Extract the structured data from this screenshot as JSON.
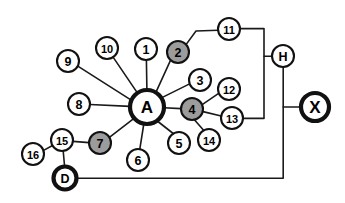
{
  "diagram": {
    "type": "node-link-network",
    "canvas": {
      "width": 345,
      "height": 203
    },
    "background_color": "#ffffff",
    "colors": {
      "node_fill_default": "#ffffff",
      "node_fill_highlight": "#9c9c9c",
      "stroke": "#111111",
      "edge": "#1a1a1a"
    },
    "nodes": [
      {
        "id": "A",
        "label": "A",
        "x": 147,
        "y": 107,
        "r": 17,
        "fill": "white",
        "emphasis": true,
        "size": "lg"
      },
      {
        "id": "X",
        "label": "X",
        "x": 315,
        "y": 107,
        "r": 14,
        "fill": "white",
        "emphasis": true,
        "size": "lg"
      },
      {
        "id": "D",
        "label": "D",
        "x": 65,
        "y": 178,
        "r": 11.5,
        "fill": "white",
        "emphasis": true,
        "size": "md"
      },
      {
        "id": "H",
        "label": "H",
        "x": 283,
        "y": 56,
        "r": 11,
        "fill": "white",
        "emphasis": false,
        "size": "md"
      },
      {
        "id": "1",
        "label": "1",
        "x": 146,
        "y": 49,
        "r": 11,
        "fill": "white",
        "emphasis": false,
        "size": "md"
      },
      {
        "id": "2",
        "label": "2",
        "x": 178,
        "y": 52,
        "r": 11,
        "fill": "gray",
        "emphasis": false,
        "size": "md"
      },
      {
        "id": "3",
        "label": "3",
        "x": 200,
        "y": 80,
        "r": 11,
        "fill": "white",
        "emphasis": false,
        "size": "md"
      },
      {
        "id": "4",
        "label": "4",
        "x": 192,
        "y": 109,
        "r": 11,
        "fill": "gray",
        "emphasis": false,
        "size": "md"
      },
      {
        "id": "5",
        "label": "5",
        "x": 179,
        "y": 143,
        "r": 11,
        "fill": "white",
        "emphasis": false,
        "size": "md"
      },
      {
        "id": "6",
        "label": "6",
        "x": 138,
        "y": 160,
        "r": 11,
        "fill": "white",
        "emphasis": false,
        "size": "md"
      },
      {
        "id": "7",
        "label": "7",
        "x": 100,
        "y": 143,
        "r": 11,
        "fill": "gray",
        "emphasis": false,
        "size": "md"
      },
      {
        "id": "8",
        "label": "8",
        "x": 79,
        "y": 104,
        "r": 11,
        "fill": "white",
        "emphasis": false,
        "size": "md"
      },
      {
        "id": "9",
        "label": "9",
        "x": 68,
        "y": 61,
        "r": 11,
        "fill": "white",
        "emphasis": false,
        "size": "md"
      },
      {
        "id": "10",
        "label": "10",
        "x": 107,
        "y": 48,
        "r": 11,
        "fill": "white",
        "emphasis": false,
        "size": "sm"
      },
      {
        "id": "11",
        "label": "11",
        "x": 229,
        "y": 29,
        "r": 11,
        "fill": "white",
        "emphasis": false,
        "size": "sm"
      },
      {
        "id": "12",
        "label": "12",
        "x": 229,
        "y": 89,
        "r": 11,
        "fill": "white",
        "emphasis": false,
        "size": "sm"
      },
      {
        "id": "13",
        "label": "13",
        "x": 232,
        "y": 118,
        "r": 11,
        "fill": "white",
        "emphasis": false,
        "size": "sm"
      },
      {
        "id": "14",
        "label": "14",
        "x": 209,
        "y": 140,
        "r": 11,
        "fill": "white",
        "emphasis": false,
        "size": "sm"
      },
      {
        "id": "15",
        "label": "15",
        "x": 62,
        "y": 140,
        "r": 11,
        "fill": "white",
        "emphasis": false,
        "size": "sm"
      },
      {
        "id": "16",
        "label": "16",
        "x": 33,
        "y": 154,
        "r": 11,
        "fill": "white",
        "emphasis": false,
        "size": "sm"
      }
    ],
    "edges": [
      {
        "from": "9",
        "to": "A",
        "kind": "straight"
      },
      {
        "from": "10",
        "to": "A",
        "kind": "straight"
      },
      {
        "from": "1",
        "to": "A",
        "kind": "straight"
      },
      {
        "from": "8",
        "to": "A",
        "kind": "straight"
      },
      {
        "from": "2",
        "to": "A",
        "kind": "straight"
      },
      {
        "from": "3",
        "to": "A",
        "kind": "straight"
      },
      {
        "from": "4",
        "to": "A",
        "kind": "straight"
      },
      {
        "from": "5",
        "to": "A",
        "kind": "straight"
      },
      {
        "from": "6",
        "to": "A",
        "kind": "straight"
      },
      {
        "from": "7",
        "to": "A",
        "kind": "straight"
      },
      {
        "from": "12",
        "to": "4",
        "kind": "straight"
      },
      {
        "from": "13",
        "to": "4",
        "kind": "straight"
      },
      {
        "from": "14",
        "to": "4",
        "kind": "straight"
      },
      {
        "from": "15",
        "to": "7",
        "kind": "straight"
      },
      {
        "from": "16",
        "to": "15",
        "kind": "straight"
      },
      {
        "from": "15",
        "to": "D",
        "kind": "straight"
      },
      {
        "from": "2",
        "to": "11",
        "kind": "orthogonal"
      },
      {
        "from": "11",
        "to": "H",
        "kind": "orthogonal"
      },
      {
        "from": "13",
        "to": "H",
        "kind": "orthogonal"
      },
      {
        "from": "H",
        "to": "X",
        "kind": "orthogonal"
      },
      {
        "from": "H",
        "to": "D",
        "kind": "orthogonal"
      }
    ],
    "edge_paths": [
      {
        "name": "edge-9-A",
        "d": "M 78.2 66.3 L 132.0 100.6"
      },
      {
        "name": "edge-10-A",
        "d": "M 113.6 57.9 L 137.2 92.6"
      },
      {
        "name": "edge-1-A",
        "d": "M 146.4 60.0 L 146.9 90.0"
      },
      {
        "name": "edge-8-A",
        "d": "M 90.0 104.5 L 130.0 106.4"
      },
      {
        "name": "edge-2-A",
        "d": "M 170.6 60.1 L 155.2 93.8"
      },
      {
        "name": "edge-3-A",
        "d": "M 189.6 83.9 L 161.4 97.9"
      },
      {
        "name": "edge-4-A",
        "d": "M 181.0 108.6 L 164.0 107.8"
      },
      {
        "name": "edge-5-A",
        "d": "M 173.2 133.5 L 156.0 120.0"
      },
      {
        "name": "edge-6-A",
        "d": "M 139.8 149.1 L 143.8 124.0"
      },
      {
        "name": "edge-7-A",
        "d": "M 109.4 137.4 L 134.0 118.4"
      },
      {
        "name": "edge-12-4",
        "d": "M 219.0 93.2 L 202.2 104.6"
      },
      {
        "name": "edge-13-4",
        "d": "M 221.2 116.0 L 203.0 111.6"
      },
      {
        "name": "edge-14-4",
        "d": "M 203.6 130.2 L 194.6 120.0"
      },
      {
        "name": "edge-15-7",
        "d": "M 73.0 141.4 L 89.0 142.6"
      },
      {
        "name": "edge-16-15",
        "d": "M 43.6 150.4 L 53.0 145.2"
      },
      {
        "name": "edge-15-D",
        "d": "M 63.2 151.0 L 64.6 166.5"
      },
      {
        "name": "edge-2-11",
        "d": "M 186.0 44.6 L 196.0 31.0 L 218.0 30.2"
      },
      {
        "name": "edge-11-H",
        "d": "M 240.0 28.6 L 264.0 28.6 L 264.0 56.2 L 272.0 56.2"
      },
      {
        "name": "edge-13-H",
        "d": "M 243.0 118.4 L 264.0 118.4 L 264.0 56.2"
      },
      {
        "name": "edge-H-X",
        "d": "M 283.2 67.0 L 283.2 107.0 L 301.0 107.0"
      },
      {
        "name": "edge-H-D",
        "d": "M 283.2 107.0 L 283.2 178.2 L 76.5 178.2"
      }
    ]
  }
}
